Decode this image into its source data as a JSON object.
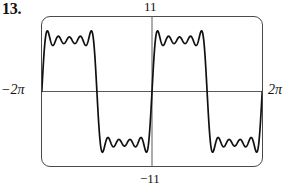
{
  "exercise": {
    "number": "13."
  },
  "figure": {
    "name": "graphing-calculator-viewport",
    "frame_color": "#4a4a4a",
    "axis_color": "#5a5a5a",
    "curve_color": "#101010"
  },
  "labels": {
    "y_max": "11",
    "y_min": "−11",
    "x_min": "−2π",
    "x_max": "2π"
  },
  "chart_data": {
    "type": "line",
    "title": "",
    "xlabel": "",
    "ylabel": "",
    "xlim": [
      -6.283185307,
      6.283185307
    ],
    "ylim": [
      -11,
      11
    ],
    "xtick_labels": [
      "−2π",
      "2π"
    ],
    "ytick_labels": [
      "11",
      "−11"
    ],
    "grid": false,
    "legend": null,
    "axes": {
      "x_axis_at_y": 0,
      "y_axis_at_x": 0,
      "show_x_axis": true,
      "show_y_axis": true
    },
    "series": [
      {
        "name": "fourier-partial-sum",
        "kind": "harmonic-sine-sum",
        "period": 6.283185307,
        "amplitude": 9.6,
        "harmonics": [
          {
            "n": 1,
            "coefficient": 1
          },
          {
            "n": 3,
            "coefficient": 0.3333333
          },
          {
            "n": 5,
            "coefficient": 0.2
          },
          {
            "n": 7,
            "coefficient": 0.1428571
          },
          {
            "n": 9,
            "coefficient": 0.1111111
          }
        ],
        "samples": 900
      }
    ]
  }
}
